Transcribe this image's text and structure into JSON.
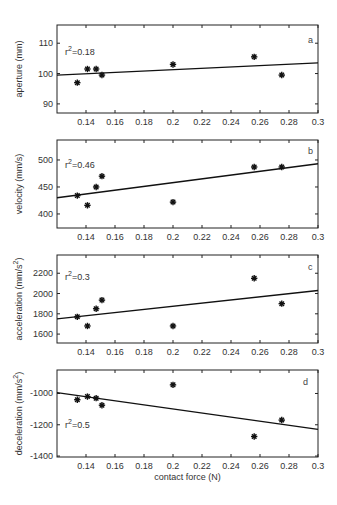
{
  "chart_data": [
    {
      "type": "scatter",
      "panel": "a",
      "title": "",
      "xlabel": "",
      "ylabel": "aperture (mm)",
      "annotation": "r²=0.18",
      "r2_label": "r",
      "r2_value": "=0.18",
      "x": [
        0.134,
        0.141,
        0.147,
        0.151,
        0.2,
        0.256,
        0.275
      ],
      "y": [
        97,
        101.5,
        101.5,
        99.5,
        103,
        105.5,
        99.5
      ],
      "fit_line": {
        "x": [
          0.12,
          0.3
        ],
        "y": [
          99.5,
          103.5
        ]
      },
      "xlim": [
        0.12,
        0.3
      ],
      "ylim": [
        87,
        116
      ],
      "yticks": [
        90,
        100,
        110
      ],
      "xticks": [
        0.14,
        0.16,
        0.18,
        0.2,
        0.22,
        0.24,
        0.26,
        0.28,
        0.3
      ],
      "grid": false,
      "legend": "none"
    },
    {
      "type": "scatter",
      "panel": "b",
      "title": "",
      "xlabel": "",
      "ylabel": "velocity (mm/s)",
      "annotation": "r²=0.46",
      "r2_label": "r",
      "r2_value": "=0.46",
      "x": [
        0.134,
        0.141,
        0.147,
        0.151,
        0.2,
        0.256,
        0.275
      ],
      "y": [
        434,
        416,
        450,
        470,
        422,
        487,
        487
      ],
      "fit_line": {
        "x": [
          0.12,
          0.3
        ],
        "y": [
          430,
          493
        ]
      },
      "xlim": [
        0.12,
        0.3
      ],
      "ylim": [
        374,
        537
      ],
      "yticks": [
        400,
        450,
        500
      ],
      "xticks": [
        0.14,
        0.16,
        0.18,
        0.2,
        0.22,
        0.24,
        0.26,
        0.28,
        0.3
      ],
      "grid": false,
      "legend": "none"
    },
    {
      "type": "scatter",
      "panel": "c",
      "title": "",
      "xlabel": "",
      "ylabel": "acceleration (mm/s²)",
      "annotation": "r²=0.3",
      "r2_label": "r",
      "r2_value": "=0.3",
      "x": [
        0.134,
        0.141,
        0.147,
        0.151,
        0.2,
        0.256,
        0.275
      ],
      "y": [
        1770,
        1680,
        1850,
        1935,
        1680,
        2150,
        1900
      ],
      "fit_line": {
        "x": [
          0.12,
          0.3
        ],
        "y": [
          1750,
          2030
        ]
      },
      "xlim": [
        0.12,
        0.3
      ],
      "ylim": [
        1512,
        2380
      ],
      "yticks": [
        1600,
        1800,
        2000,
        2200
      ],
      "xticks": [
        0.14,
        0.16,
        0.18,
        0.2,
        0.22,
        0.24,
        0.26,
        0.28,
        0.3
      ],
      "grid": false,
      "legend": "none"
    },
    {
      "type": "scatter",
      "panel": "d",
      "title": "",
      "xlabel": "contact force (N)",
      "ylabel": "deceleration (mm/s²)",
      "annotation": "r²=0.5",
      "r2_label": "r",
      "r2_value": "=0.5",
      "x": [
        0.134,
        0.141,
        0.147,
        0.151,
        0.2,
        0.256,
        0.275
      ],
      "y": [
        -1040,
        -1020,
        -1030,
        -1075,
        -945,
        -1275,
        -1170
      ],
      "fit_line": {
        "x": [
          0.12,
          0.3
        ],
        "y": [
          -995,
          -1230
        ]
      },
      "xlim": [
        0.12,
        0.3
      ],
      "ylim": [
        -1406,
        -850
      ],
      "yticks": [
        -1400,
        -1200,
        -1000
      ],
      "xticks": [
        0.14,
        0.16,
        0.18,
        0.2,
        0.22,
        0.24,
        0.26,
        0.28,
        0.3
      ],
      "grid": false,
      "legend": "none"
    }
  ],
  "labels": {
    "a": {
      "letter": "a",
      "ylabel": "aperture (mm)",
      "r": "r",
      "sup": "2",
      "val": "=0.18"
    },
    "b": {
      "letter": "b",
      "ylabel": "velocity (mm/s)",
      "r": "r",
      "sup": "2",
      "val": "=0.46"
    },
    "c": {
      "letter": "c",
      "ylabel": "acceleration (mm/s",
      "ysup": "2",
      "yclose": ")",
      "r": "r",
      "sup": "2",
      "val": "=0.3"
    },
    "d": {
      "letter": "d",
      "ylabel": "deceleration (mm/s",
      "ysup": "2",
      "yclose": ")",
      "r": "r",
      "sup": "2",
      "val": "=0.5"
    },
    "xlabel": "contact force (N)",
    "xticks": [
      "0.14",
      "0.16",
      "0.18",
      "0.2",
      "0.22",
      "0.24",
      "0.26",
      "0.28",
      "0.3"
    ],
    "a_yticks": [
      "90",
      "100",
      "110"
    ],
    "b_yticks": [
      "400",
      "450",
      "500"
    ],
    "c_yticks": [
      "1600",
      "1800",
      "2000",
      "2200"
    ],
    "d_yticks": [
      "-1400",
      "-1200",
      "-1000"
    ]
  }
}
